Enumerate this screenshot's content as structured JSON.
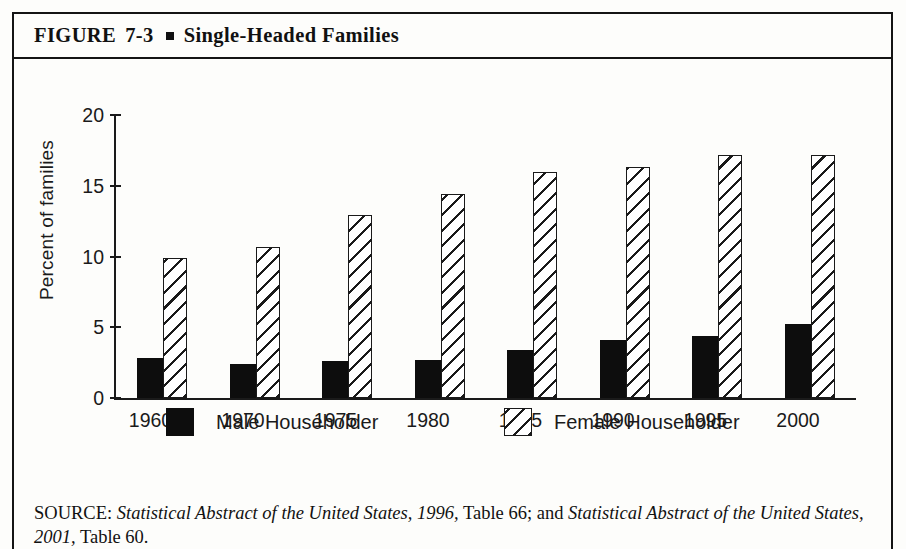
{
  "figure": {
    "label": "FIGURE",
    "number": "7-3",
    "title": "Single-Headed Families",
    "bullet_icon": "square-bullet-icon"
  },
  "source": {
    "prefix": "SOURCE:",
    "ref1_title": "Statistical Abstract of the United States, 1996,",
    "ref1_table": "Table 66; and",
    "ref2_title": "Statistical Abstract of the United States, 2001,",
    "ref2_table": "Table 60."
  },
  "chart_data": {
    "type": "bar",
    "title": "Single-Headed Families",
    "categories": [
      "1960",
      "1970",
      "1975",
      "1980",
      "1985",
      "1990",
      "1995",
      "2000"
    ],
    "series": [
      {
        "name": "Male Householder",
        "values": [
          2.8,
          2.4,
          2.6,
          2.7,
          3.4,
          4.1,
          4.4,
          5.2
        ],
        "color": "#0d0d0d",
        "fill": "solid"
      },
      {
        "name": "Female Householder",
        "values": [
          9.9,
          10.7,
          12.9,
          14.4,
          16.0,
          16.3,
          17.2,
          17.2
        ],
        "color": "#1a1a1a",
        "fill": "diagonal-hatch"
      }
    ],
    "xlabel": "",
    "ylabel": "Percent of families",
    "ylim": [
      0,
      20
    ],
    "yticks": [
      0,
      5,
      10,
      15,
      20
    ],
    "ytick_labels": [
      "0",
      "5",
      "10",
      "15",
      "20"
    ],
    "grid": false,
    "legend_position": "bottom"
  }
}
